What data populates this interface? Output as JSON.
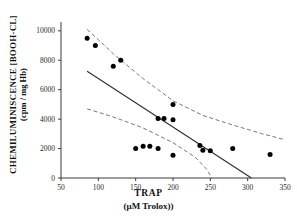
{
  "chart_data": {
    "type": "scatter",
    "title": "",
    "xlabel": "TRAP",
    "xlabel_sub": "(μM Trolox))",
    "ylabel": "CHEMILUMINISCENCE [BOOH-CL]",
    "ylabel_sub": "(cpm / mg Hb)",
    "xlim": [
      50,
      350
    ],
    "ylim": [
      0,
      10600
    ],
    "xticks": [
      50,
      100,
      150,
      200,
      250,
      300,
      350
    ],
    "yticks": [
      0,
      2000,
      4000,
      6000,
      8000,
      10000
    ],
    "xticklabels": [
      "50",
      "100",
      "150",
      "200",
      "250",
      "300",
      "350"
    ],
    "yticklabels": [
      "0",
      "2000",
      "4000",
      "6000",
      "8000",
      "10000"
    ],
    "grid": false,
    "legend": "none",
    "marker": "filled-circle",
    "marker_color": "#000000",
    "points": [
      {
        "x": 85,
        "y": 9500
      },
      {
        "x": 96,
        "y": 9000
      },
      {
        "x": 120,
        "y": 7600
      },
      {
        "x": 130,
        "y": 8000
      },
      {
        "x": 200,
        "y": 5000
      },
      {
        "x": 180,
        "y": 4050
      },
      {
        "x": 188,
        "y": 4050
      },
      {
        "x": 200,
        "y": 3950
      },
      {
        "x": 150,
        "y": 2000
      },
      {
        "x": 160,
        "y": 2150
      },
      {
        "x": 169,
        "y": 2150
      },
      {
        "x": 180,
        "y": 2000
      },
      {
        "x": 200,
        "y": 1550
      },
      {
        "x": 236,
        "y": 2200
      },
      {
        "x": 240,
        "y": 1880
      },
      {
        "x": 250,
        "y": 1850
      },
      {
        "x": 280,
        "y": 2000
      },
      {
        "x": 330,
        "y": 1600
      }
    ],
    "series": [
      {
        "name": "regression-line",
        "style": "solid",
        "color": "#2d2d2d",
        "x": [
          85,
          305
        ],
        "values": [
          7250,
          0
        ]
      },
      {
        "name": "upper-confidence-band",
        "style": "dashed",
        "color": "#555555",
        "x": [
          85,
          120,
          160,
          200,
          240,
          280,
          320,
          350
        ],
        "values": [
          10100,
          8450,
          6750,
          5250,
          4250,
          3600,
          3000,
          2600
        ]
      },
      {
        "name": "lower-confidence-band",
        "style": "dashed",
        "color": "#555555",
        "x": [
          85,
          120,
          160,
          200,
          230,
          245,
          252
        ],
        "values": [
          4700,
          4150,
          3400,
          2400,
          1400,
          600,
          0
        ]
      }
    ]
  }
}
